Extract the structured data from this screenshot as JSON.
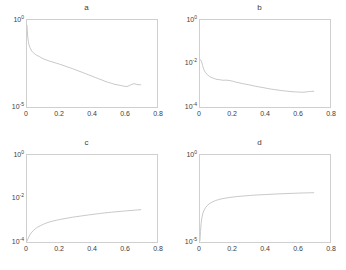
{
  "figure": {
    "background": "#ffffff",
    "curve_color": "#b9b9b9",
    "axis_color": "#cfcfcf",
    "layout": "2x2 grid of semilog-y plots"
  },
  "chart_data": [
    {
      "type": "line",
      "panel": "a",
      "title": "a",
      "xlabel": "",
      "ylabel": "",
      "yscale": "log",
      "xscale": "linear",
      "xlim": [
        0,
        0.8
      ],
      "ylim": [
        1e-05,
        1
      ],
      "xticks": [
        0,
        0.2,
        0.4,
        0.6,
        0.8
      ],
      "xticklabels": [
        "0",
        "0.2",
        "0.4",
        "0.6",
        "0.8"
      ],
      "yticks": [
        1e-05,
        1
      ],
      "yticklabels": [
        "10-5",
        "100"
      ],
      "ytick_display": [
        {
          "mantissa": "10",
          "exponent": "0"
        },
        {
          "mantissa": "10",
          "exponent": "-5"
        }
      ],
      "grid": false,
      "legend": null,
      "x": [
        0.0,
        0.004,
        0.008,
        0.012,
        0.018,
        0.025,
        0.033,
        0.042,
        0.052,
        0.062,
        0.075,
        0.09,
        0.105,
        0.12,
        0.14,
        0.16,
        0.18,
        0.2,
        0.22,
        0.24,
        0.26,
        0.28,
        0.3,
        0.32,
        0.34,
        0.36,
        0.38,
        0.4,
        0.42,
        0.44,
        0.46,
        0.48,
        0.5,
        0.52,
        0.54,
        0.56,
        0.58,
        0.6,
        0.615,
        0.63,
        0.645,
        0.66,
        0.675,
        0.69,
        0.7
      ],
      "y": [
        0.5,
        0.12,
        0.06,
        0.038,
        0.026,
        0.019,
        0.015,
        0.0125,
        0.0105,
        0.0092,
        0.008,
        0.0066,
        0.0056,
        0.005,
        0.0043,
        0.0038,
        0.0033,
        0.0029,
        0.0025,
        0.00215,
        0.00185,
        0.0016,
        0.00135,
        0.00115,
        0.00098,
        0.00083,
        0.0007,
        0.00059,
        0.0005,
        0.00042,
        0.00036,
        0.0003,
        0.00026,
        0.00023,
        0.0002,
        0.000185,
        0.00017,
        0.000155,
        0.00015,
        0.00017,
        0.0002,
        0.00022,
        0.0002,
        0.00019,
        0.00019
      ],
      "description": "Monotonic decay over four decades with small upturn near x=0.63"
    },
    {
      "type": "line",
      "panel": "b",
      "title": "b",
      "xlabel": "",
      "ylabel": "",
      "yscale": "log",
      "xscale": "linear",
      "xlim": [
        0,
        0.8
      ],
      "ylim": [
        0.0001,
        1
      ],
      "xticks": [
        0,
        0.2,
        0.4,
        0.6,
        0.8
      ],
      "xticklabels": [
        "0",
        "0.2",
        "0.4",
        "0.6",
        "0.8"
      ],
      "yticks": [
        0.0001,
        0.01,
        1
      ],
      "yticklabels": [
        "10-4",
        "10-2",
        "100"
      ],
      "ytick_display": [
        {
          "mantissa": "10",
          "exponent": "0"
        },
        {
          "mantissa": "10",
          "exponent": "-2"
        },
        {
          "mantissa": "10",
          "exponent": "-4"
        }
      ],
      "grid": false,
      "legend": null,
      "x": [
        0.0,
        0.005,
        0.01,
        0.016,
        0.024,
        0.034,
        0.046,
        0.06,
        0.075,
        0.09,
        0.105,
        0.12,
        0.14,
        0.16,
        0.18,
        0.2,
        0.22,
        0.24,
        0.26,
        0.28,
        0.3,
        0.32,
        0.34,
        0.36,
        0.38,
        0.4,
        0.42,
        0.44,
        0.46,
        0.48,
        0.5,
        0.52,
        0.54,
        0.56,
        0.58,
        0.6,
        0.62,
        0.64,
        0.66,
        0.68,
        0.7
      ],
      "y": [
        0.015,
        0.0145,
        0.012,
        0.008,
        0.0052,
        0.0038,
        0.003,
        0.0025,
        0.0022,
        0.002,
        0.00185,
        0.0018,
        0.0017,
        0.00172,
        0.00165,
        0.00155,
        0.0014,
        0.0013,
        0.0012,
        0.00112,
        0.00105,
        0.00098,
        0.0009,
        0.00085,
        0.0008,
        0.00075,
        0.0007,
        0.00066,
        0.00063,
        0.0006,
        0.00057,
        0.00055,
        0.00053,
        0.00051,
        0.0005,
        0.00049,
        0.00048,
        0.00048,
        0.0005,
        0.00052,
        0.00053
      ],
      "description": "Decay from about 1.5e-2 flattening near 5e-4"
    },
    {
      "type": "line",
      "panel": "c",
      "title": "c",
      "xlabel": "",
      "ylabel": "",
      "yscale": "log",
      "xscale": "linear",
      "xlim": [
        0,
        0.8
      ],
      "ylim": [
        0.0001,
        1
      ],
      "xticks": [
        0,
        0.2,
        0.4,
        0.6,
        0.8
      ],
      "xticklabels": [
        "0",
        "0.2",
        "0.4",
        "0.6",
        "0.8"
      ],
      "yticks": [
        0.0001,
        0.01,
        1
      ],
      "yticklabels": [
        "10-4",
        "10-2",
        "100"
      ],
      "ytick_display": [
        {
          "mantissa": "10",
          "exponent": "0"
        },
        {
          "mantissa": "10",
          "exponent": "-2"
        },
        {
          "mantissa": "10",
          "exponent": "-4"
        }
      ],
      "grid": false,
      "legend": null,
      "x": [
        0.0,
        0.006,
        0.014,
        0.024,
        0.036,
        0.05,
        0.065,
        0.082,
        0.1,
        0.12,
        0.14,
        0.16,
        0.18,
        0.2,
        0.22,
        0.24,
        0.26,
        0.28,
        0.3,
        0.32,
        0.34,
        0.36,
        0.38,
        0.4,
        0.42,
        0.44,
        0.46,
        0.48,
        0.5,
        0.52,
        0.54,
        0.56,
        0.58,
        0.6,
        0.62,
        0.64,
        0.66,
        0.68,
        0.7
      ],
      "y": [
        0.00011,
        0.00014,
        0.00019,
        0.00025,
        0.00032,
        0.0004,
        0.00048,
        0.00056,
        0.00065,
        0.00075,
        0.00084,
        0.00092,
        0.001,
        0.00108,
        0.00115,
        0.00122,
        0.0013,
        0.00138,
        0.00145,
        0.00152,
        0.0016,
        0.00168,
        0.00176,
        0.00184,
        0.00192,
        0.002,
        0.0021,
        0.00218,
        0.00226,
        0.00234,
        0.00242,
        0.0025,
        0.00258,
        0.00266,
        0.00274,
        0.00282,
        0.0029,
        0.00298,
        0.00305
      ],
      "description": "Monotonic rise from 1e-4 to about 3e-3, concave in log space"
    },
    {
      "type": "line",
      "panel": "d",
      "title": "d",
      "xlabel": "",
      "ylabel": "",
      "yscale": "log",
      "xscale": "linear",
      "xlim": [
        0,
        0.8
      ],
      "ylim": [
        1e-05,
        1
      ],
      "xticks": [
        0,
        0.2,
        0.4,
        0.6,
        0.8
      ],
      "xticklabels": [
        "0",
        "0.2",
        "0.4",
        "0.6",
        "0.8"
      ],
      "yticks": [
        1e-05,
        1
      ],
      "yticklabels": [
        "10-5",
        "100"
      ],
      "ytick_display": [
        {
          "mantissa": "10",
          "exponent": "0"
        },
        {
          "mantissa": "10",
          "exponent": "-5"
        }
      ],
      "grid": false,
      "legend": null,
      "x": [
        0.0,
        0.003,
        0.007,
        0.012,
        0.018,
        0.026,
        0.036,
        0.048,
        0.062,
        0.078,
        0.095,
        0.115,
        0.135,
        0.155,
        0.18,
        0.205,
        0.23,
        0.255,
        0.28,
        0.305,
        0.33,
        0.355,
        0.38,
        0.405,
        0.43,
        0.455,
        0.48,
        0.505,
        0.53,
        0.555,
        0.58,
        0.605,
        0.63,
        0.655,
        0.68,
        0.7
      ],
      "y": [
        1.2e-05,
        4e-05,
        0.00012,
        0.00026,
        0.00046,
        0.0007,
        0.001,
        0.00135,
        0.0017,
        0.00205,
        0.0024,
        0.00275,
        0.00305,
        0.0033,
        0.0036,
        0.00385,
        0.0041,
        0.0043,
        0.0045,
        0.0047,
        0.0049,
        0.00505,
        0.0052,
        0.00535,
        0.0055,
        0.00565,
        0.0058,
        0.00595,
        0.00605,
        0.0062,
        0.0063,
        0.00645,
        0.00655,
        0.00665,
        0.00675,
        0.0068
      ],
      "description": "Sharp rise then saturation near 7e-3"
    }
  ]
}
